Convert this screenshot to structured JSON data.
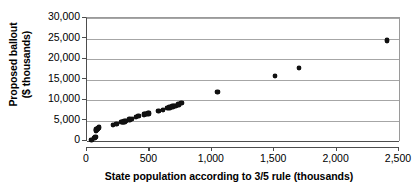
{
  "chart_data": {
    "type": "scatter",
    "title": "",
    "xlabel": "State population according to 3/5 rule (thousands)",
    "ylabel_line1": "Proposed ballout",
    "ylabel_line2": "($ thousands)",
    "xlim": [
      0,
      2500
    ],
    "ylim": [
      0,
      30000
    ],
    "grid": true,
    "legend": "none",
    "x_ticks": [
      0,
      500,
      1000,
      1500,
      2000,
      2500
    ],
    "x_tick_labels": [
      "0",
      "500",
      "1,000",
      "1,500",
      "2,000",
      "2,500"
    ],
    "y_ticks": [
      0,
      5000,
      10000,
      15000,
      20000,
      25000,
      30000
    ],
    "y_tick_labels": [
      "0",
      "5,000",
      "10,000",
      "15,000",
      "20,000",
      "25,000",
      "30,000"
    ],
    "marker": "diamond-filled",
    "marker_color": "#111111",
    "series": [
      {
        "name": "States",
        "points": [
          [
            37,
            200
          ],
          [
            59,
            800
          ],
          [
            68,
            1000
          ],
          [
            72,
            2600
          ],
          [
            77,
            2800
          ],
          [
            83,
            3000
          ],
          [
            89,
            3100
          ],
          [
            96,
            3300
          ],
          [
            207,
            3900
          ],
          [
            237,
            4200
          ],
          [
            277,
            4600
          ],
          [
            283,
            4700
          ],
          [
            291,
            4700
          ],
          [
            299,
            4800
          ],
          [
            314,
            4900
          ],
          [
            341,
            5200
          ],
          [
            359,
            5400
          ],
          [
            393,
            5900
          ],
          [
            412,
            6100
          ],
          [
            455,
            6500
          ],
          [
            468,
            6600
          ],
          [
            477,
            6600
          ],
          [
            487,
            6700
          ],
          [
            495,
            6700
          ],
          [
            573,
            7300
          ],
          [
            608,
            7600
          ],
          [
            645,
            8000
          ],
          [
            662,
            8200
          ],
          [
            684,
            8400
          ],
          [
            699,
            8500
          ],
          [
            709,
            8600
          ],
          [
            733,
            8900
          ],
          [
            757,
            9200
          ],
          [
            1045,
            11900
          ],
          [
            1505,
            15800
          ],
          [
            1700,
            17800
          ],
          [
            2405,
            24500
          ]
        ]
      }
    ]
  },
  "axes": {
    "y_title_line1": "Proposed ballout",
    "y_title_line2": "($ thousands)",
    "x_title": "State population according to 3/5 rule (thousands)"
  },
  "colors": {
    "marker": "#111111",
    "gridline": "#a6a6a6",
    "axis": "#4d4d4d",
    "background": "#ffffff"
  }
}
